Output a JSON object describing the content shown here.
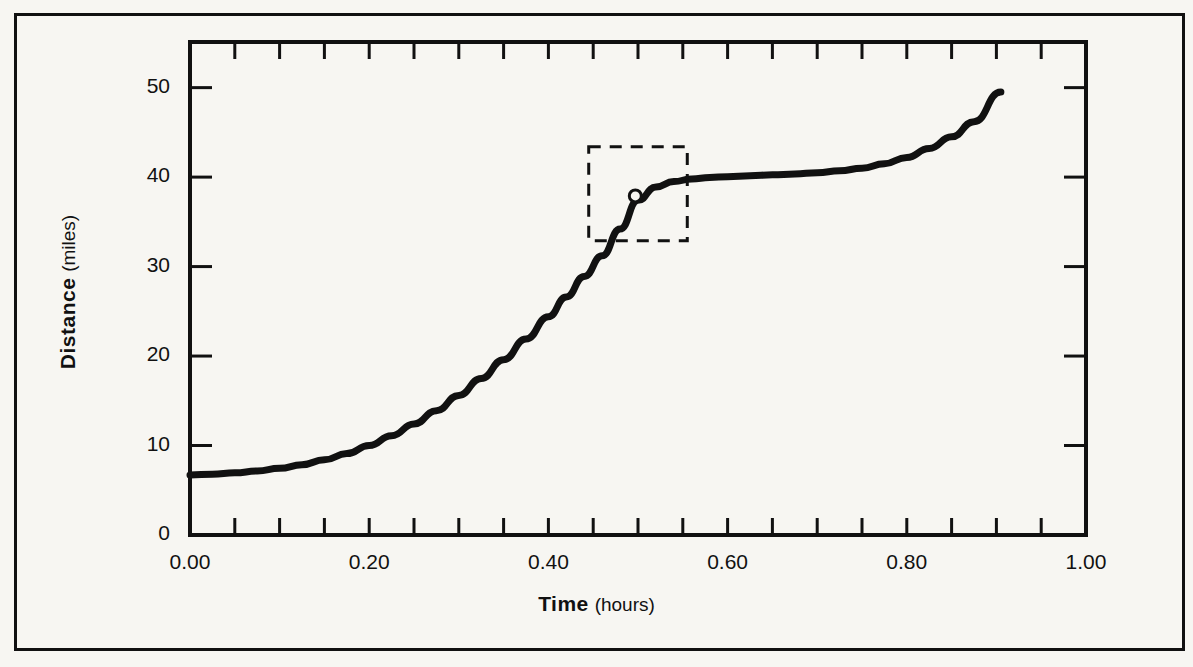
{
  "figure": {
    "background_color": "#f7f6f2",
    "ink_color": "#111111",
    "frame": {
      "border_width": 3
    }
  },
  "axes": {
    "x": {
      "title_bold": "Time",
      "title_light": "(hours)",
      "tick_labels": [
        "0.00",
        "0.20",
        "0.40",
        "0.60",
        "0.80",
        "1.00"
      ],
      "tick_values": [
        0.0,
        0.2,
        0.4,
        0.6,
        0.8,
        1.0
      ],
      "minor_step": 0.05,
      "range": [
        0.0,
        1.0
      ]
    },
    "y": {
      "title_bold": "Distance",
      "title_light": "(miles)",
      "tick_labels": [
        "0",
        "10",
        "20",
        "30",
        "40",
        "50"
      ],
      "tick_values": [
        0,
        10,
        20,
        30,
        40,
        50
      ],
      "range": [
        0,
        55.1
      ]
    }
  },
  "annotations": {
    "dashed_box": {
      "x0": 0.445,
      "x1": 0.555,
      "y0": 32.9,
      "y1": 43.4,
      "dash_pattern": "12 9",
      "stroke_width": 3
    },
    "marker_point": {
      "x": 0.497,
      "y": 37.9,
      "radius": 6,
      "fill": "#f7f6f2",
      "stroke": "#111111",
      "stroke_width": 3
    }
  },
  "chart_data": {
    "type": "line",
    "title": "",
    "xlabel": "Time (hours)",
    "ylabel": "Distance (miles)",
    "xlim": [
      0.0,
      1.0
    ],
    "ylim": [
      0,
      55.1
    ],
    "grid": false,
    "legend": null,
    "series": [
      {
        "name": "Distance traveled",
        "stroke": "#111111",
        "stroke_width": 7,
        "x": [
          0.0,
          0.025,
          0.05,
          0.075,
          0.1,
          0.125,
          0.15,
          0.175,
          0.2,
          0.225,
          0.25,
          0.275,
          0.3,
          0.325,
          0.35,
          0.375,
          0.4,
          0.42,
          0.44,
          0.46,
          0.48,
          0.5,
          0.52,
          0.54,
          0.56,
          0.58,
          0.6,
          0.625,
          0.65,
          0.675,
          0.7,
          0.725,
          0.75,
          0.775,
          0.8,
          0.825,
          0.85,
          0.875,
          0.905
        ],
        "y": [
          6.7,
          6.8,
          6.95,
          7.15,
          7.45,
          7.85,
          8.4,
          9.1,
          10.0,
          11.1,
          12.4,
          13.9,
          15.6,
          17.5,
          19.6,
          21.9,
          24.4,
          26.6,
          28.9,
          31.2,
          34.2,
          37.4,
          38.9,
          39.5,
          39.8,
          39.95,
          40.05,
          40.15,
          40.25,
          40.35,
          40.5,
          40.7,
          41.0,
          41.5,
          42.2,
          43.2,
          44.5,
          46.2,
          49.5
        ]
      }
    ]
  }
}
